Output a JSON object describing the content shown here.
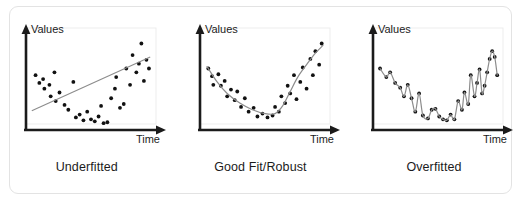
{
  "figure": {
    "title_alt": "Model fitting comparison",
    "background_color": "#ffffff",
    "card_border_color": "#e3e3e3",
    "axis_color": "#1b1b1b",
    "point_color": "#111111",
    "curve_color": "#8c8c8c",
    "plot_frame_color": "#ededed"
  },
  "panels": [
    {
      "caption": "Underfitted",
      "y_axis_label": "Values",
      "x_axis_label": "Time",
      "fit_type": "line"
    },
    {
      "caption": "Good Fit/Robust",
      "y_axis_label": "Values",
      "x_axis_label": "Time",
      "fit_type": "smooth-curve"
    },
    {
      "caption": "Overfitted",
      "y_axis_label": "Values",
      "x_axis_label": "Time",
      "fit_type": "interpolating-wiggle"
    }
  ],
  "chart_data": [
    {
      "type": "scatter",
      "title": "Underfitted",
      "xlabel": "Time",
      "ylabel": "Values",
      "xlim": [
        0,
        100
      ],
      "ylim": [
        0,
        100
      ],
      "grid": false,
      "legend": "none",
      "points": [
        [
          6,
          55
        ],
        [
          9,
          47
        ],
        [
          12,
          51
        ],
        [
          13,
          41
        ],
        [
          17,
          45
        ],
        [
          18,
          33
        ],
        [
          21,
          58
        ],
        [
          22,
          28
        ],
        [
          25,
          37
        ],
        [
          29,
          24
        ],
        [
          32,
          19
        ],
        [
          36,
          48
        ],
        [
          38,
          11
        ],
        [
          41,
          14
        ],
        [
          44,
          8
        ],
        [
          47,
          17
        ],
        [
          50,
          9
        ],
        [
          53,
          7
        ],
        [
          56,
          12
        ],
        [
          58,
          23
        ],
        [
          60,
          5
        ],
        [
          63,
          6
        ],
        [
          66,
          31
        ],
        [
          69,
          41
        ],
        [
          70,
          53
        ],
        [
          73,
          21
        ],
        [
          76,
          25
        ],
        [
          78,
          62
        ],
        [
          81,
          45
        ],
        [
          83,
          76
        ],
        [
          86,
          58
        ],
        [
          88,
          67
        ],
        [
          90,
          88
        ],
        [
          92,
          49
        ],
        [
          94,
          71
        ],
        [
          96,
          62
        ]
      ],
      "fit": {
        "name": "linear fit",
        "type": "line",
        "points": [
          [
            3,
            18
          ],
          [
            97,
            74
          ]
        ]
      }
    },
    {
      "type": "scatter",
      "title": "Good Fit/Robust",
      "xlabel": "Time",
      "ylabel": "Values",
      "xlim": [
        0,
        100
      ],
      "ylim": [
        0,
        100
      ],
      "grid": false,
      "legend": "none",
      "points": [
        [
          5,
          62
        ],
        [
          8,
          54
        ],
        [
          9,
          45
        ],
        [
          13,
          56
        ],
        [
          15,
          44
        ],
        [
          18,
          49
        ],
        [
          20,
          33
        ],
        [
          23,
          40
        ],
        [
          26,
          29
        ],
        [
          28,
          38
        ],
        [
          31,
          22
        ],
        [
          34,
          31
        ],
        [
          37,
          17
        ],
        [
          41,
          21
        ],
        [
          44,
          12
        ],
        [
          48,
          15
        ],
        [
          52,
          11
        ],
        [
          56,
          13
        ],
        [
          58,
          22
        ],
        [
          61,
          17
        ],
        [
          63,
          33
        ],
        [
          66,
          26
        ],
        [
          68,
          44
        ],
        [
          70,
          36
        ],
        [
          73,
          55
        ],
        [
          75,
          30
        ],
        [
          78,
          48
        ],
        [
          80,
          63
        ],
        [
          83,
          41
        ],
        [
          86,
          72
        ],
        [
          88,
          55
        ],
        [
          90,
          80
        ],
        [
          93,
          66
        ],
        [
          95,
          88
        ]
      ],
      "fit": {
        "name": "smooth curve fit",
        "type": "curve",
        "points": [
          [
            4,
            64
          ],
          [
            12,
            48
          ],
          [
            20,
            36
          ],
          [
            30,
            26
          ],
          [
            40,
            19
          ],
          [
            50,
            15
          ],
          [
            58,
            15
          ],
          [
            64,
            23
          ],
          [
            70,
            38
          ],
          [
            76,
            53
          ],
          [
            83,
            66
          ],
          [
            90,
            78
          ],
          [
            96,
            86
          ]
        ]
      }
    },
    {
      "type": "scatter",
      "title": "Overfitted",
      "xlabel": "Time",
      "ylabel": "Values",
      "xlim": [
        0,
        100
      ],
      "ylim": [
        0,
        100
      ],
      "grid": false,
      "legend": "none",
      "points": [
        [
          4,
          62
        ],
        [
          9,
          53
        ],
        [
          12,
          58
        ],
        [
          16,
          47
        ],
        [
          20,
          42
        ],
        [
          23,
          33
        ],
        [
          26,
          45
        ],
        [
          29,
          31
        ],
        [
          32,
          17
        ],
        [
          35,
          36
        ],
        [
          38,
          13
        ],
        [
          42,
          10
        ],
        [
          45,
          19
        ],
        [
          48,
          20
        ],
        [
          51,
          12
        ],
        [
          54,
          9
        ],
        [
          57,
          8
        ],
        [
          60,
          14
        ],
        [
          63,
          9
        ],
        [
          66,
          28
        ],
        [
          69,
          19
        ],
        [
          71,
          37
        ],
        [
          74,
          25
        ],
        [
          76,
          55
        ],
        [
          79,
          33
        ],
        [
          81,
          47
        ],
        [
          83,
          61
        ],
        [
          85,
          36
        ],
        [
          87,
          44
        ],
        [
          89,
          58
        ],
        [
          91,
          72
        ],
        [
          93,
          80
        ],
        [
          95,
          74
        ],
        [
          97,
          55
        ]
      ],
      "fit": {
        "name": "overfitted interpolation",
        "type": "curve",
        "points": [
          [
            4,
            62
          ],
          [
            9,
            53
          ],
          [
            12,
            58
          ],
          [
            16,
            47
          ],
          [
            20,
            42
          ],
          [
            23,
            33
          ],
          [
            26,
            45
          ],
          [
            29,
            31
          ],
          [
            32,
            17
          ],
          [
            35,
            36
          ],
          [
            38,
            13
          ],
          [
            42,
            10
          ],
          [
            45,
            19
          ],
          [
            48,
            20
          ],
          [
            51,
            12
          ],
          [
            54,
            9
          ],
          [
            57,
            8
          ],
          [
            60,
            14
          ],
          [
            63,
            9
          ],
          [
            66,
            28
          ],
          [
            69,
            19
          ],
          [
            71,
            37
          ],
          [
            74,
            25
          ],
          [
            76,
            55
          ],
          [
            79,
            33
          ],
          [
            81,
            47
          ],
          [
            83,
            61
          ],
          [
            85,
            36
          ],
          [
            87,
            44
          ],
          [
            89,
            58
          ],
          [
            91,
            72
          ],
          [
            93,
            80
          ],
          [
            95,
            74
          ],
          [
            97,
            55
          ]
        ]
      }
    }
  ]
}
